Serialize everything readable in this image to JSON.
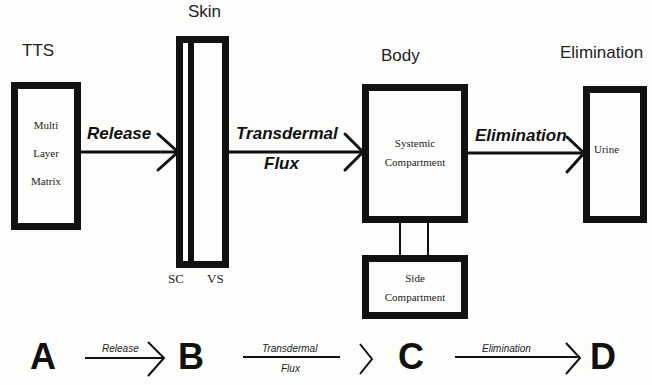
{
  "headers": {
    "tts": "TTS",
    "skin": "Skin",
    "body": "Body",
    "elimination": "Elimination"
  },
  "boxes": {
    "tts": [
      "Multi",
      "Layer",
      "Matrix"
    ],
    "skin": {
      "sc": "SC",
      "vs": "VS"
    },
    "systemic": [
      "Systemic",
      "Compartment"
    ],
    "side": [
      "Side",
      "Compartment"
    ],
    "urine": "Urine"
  },
  "arrows": {
    "release": "Release",
    "transdermal": "Transdermal",
    "flux": "Flux",
    "elimination": "Elimination"
  },
  "scheme": {
    "nodes": [
      "A",
      "B",
      "C",
      "D"
    ],
    "release": "Release",
    "transdermal": "Transdermal",
    "flux": "Flux",
    "elimination": "Elimination"
  }
}
